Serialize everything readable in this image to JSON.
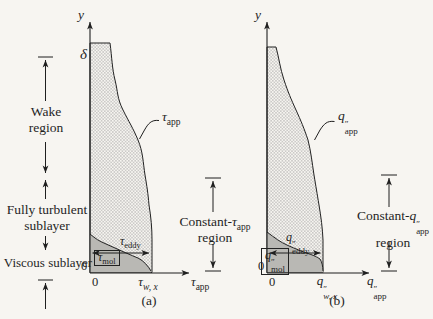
{
  "colors": {
    "ink": "#1f1f1f",
    "paper": "#f7f5f1",
    "mol_gray": "#b9b8b4",
    "hatch_dot": "#8a8a8a"
  },
  "panel_a": {
    "y_axis_label": "y",
    "delta_label": "δ",
    "zero_y": "0",
    "zero_x": "0",
    "wall_shear": {
      "base": "τ",
      "sub": "w, x"
    },
    "x_axis": {
      "base": "τ",
      "sub": "app"
    },
    "curve": {
      "base": "τ",
      "sub": "app"
    },
    "eddy": {
      "base": "τ",
      "sub": "eddy"
    },
    "mol": {
      "base": "τ",
      "sub": "mol"
    },
    "caption": "(a)"
  },
  "panel_b": {
    "y_axis_label": "y",
    "zero_y": "0",
    "zero_x": "0",
    "wall_flux": {
      "base": "q",
      "prime": "″",
      "sub": "w, x"
    },
    "x_axis": {
      "base": "q",
      "prime": "″",
      "sub": "app"
    },
    "curve": {
      "base": "q",
      "prime": "″",
      "sub": "app"
    },
    "eddy": {
      "base": "q",
      "prime": "″",
      "sub": "eddy"
    },
    "mol": {
      "base": "q",
      "prime": "″",
      "sub": "mol"
    },
    "caption": "(b)"
  },
  "annotations": {
    "wake": {
      "line1": "Wake",
      "line2": "region"
    },
    "fully_turbulent": {
      "line1": "Fully turbulent",
      "line2": "sublayer"
    },
    "viscous": {
      "line1": "Viscous sublayer"
    },
    "constant_tau": {
      "prefix": "Constant-",
      "symbol": {
        "base": "τ",
        "sub": "app"
      },
      "line2": "region"
    },
    "constant_q": {
      "prefix": "Constant-",
      "symbol": {
        "base": "q",
        "prime": "″",
        "sub": "app"
      },
      "line2": "region"
    }
  }
}
